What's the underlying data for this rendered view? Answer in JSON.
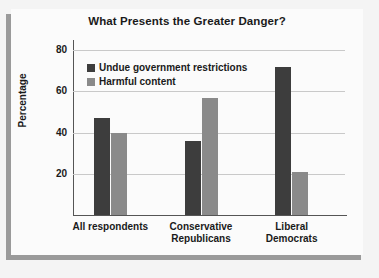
{
  "chart_data": {
    "type": "bar",
    "title": "What Presents the Greater Danger?",
    "xlabel": "",
    "ylabel": "Percentage",
    "categories": [
      "All respondents",
      "Conservative Republicans",
      "Liberal Democrats"
    ],
    "category_lines": [
      [
        "All respondents"
      ],
      [
        "Conservative",
        "Republicans"
      ],
      [
        "Liberal",
        "Democrats"
      ]
    ],
    "series": [
      {
        "name": "Undue government restrictions",
        "color": "#3d3d3d",
        "values": [
          47,
          36,
          72
        ]
      },
      {
        "name": "Harmful content",
        "color": "#8a8a8a",
        "values": [
          40,
          57,
          21
        ]
      }
    ],
    "ylim": [
      0,
      85
    ],
    "yticks": [
      20,
      40,
      60,
      80
    ],
    "ytick_labels": [
      "20",
      "40",
      "60",
      "80"
    ],
    "grid": true,
    "legend_position": "top-left inside plot"
  },
  "colors": {
    "series_dark": "#3d3d3d",
    "series_light": "#8a8a8a",
    "gridline": "#c9c9c9",
    "axis": "#555555",
    "card_background": "#fbfbfb",
    "page_background": "#f4f4f4",
    "frame_shadow": "#9a9a9a",
    "text": "#1a1a1a"
  }
}
